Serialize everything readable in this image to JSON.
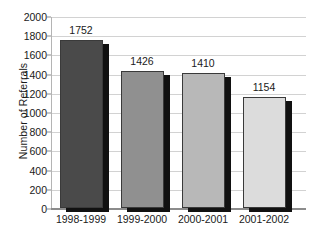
{
  "chart_data": {
    "type": "bar",
    "title": "",
    "subtitle": "",
    "xlabel": "",
    "ylabel": "Number of Referrals",
    "categories": [
      "1998-1999",
      "1999-2000",
      "2000-2001",
      "2001-2002"
    ],
    "values": [
      1752,
      1426,
      1410,
      1154
    ],
    "data_labels": [
      "1752",
      "1426",
      "1410",
      "1154"
    ],
    "ylim": [
      0,
      2000
    ],
    "ytick_labels": [
      "2000",
      "1800",
      "1600",
      "1400",
      "1200",
      "1000",
      "800",
      "600",
      "400",
      "200",
      "0"
    ],
    "ytick_values": [
      2000,
      1800,
      1600,
      1400,
      1200,
      1000,
      800,
      600,
      400,
      200,
      0
    ],
    "ytick_step": 200,
    "grid": true,
    "legend": null,
    "legend_position": "none",
    "bar_colors": [
      "#4a4a4a",
      "#909090",
      "#b8b8b8",
      "#dcdcdc"
    ],
    "bar_shadow_color": "#111111",
    "bar_border_color": "#3a3a3a",
    "gridline_color": "#d2d2d2",
    "axis_color": "#8c8c8c",
    "text_color": "#1a1a1a",
    "background": "#ffffff"
  }
}
